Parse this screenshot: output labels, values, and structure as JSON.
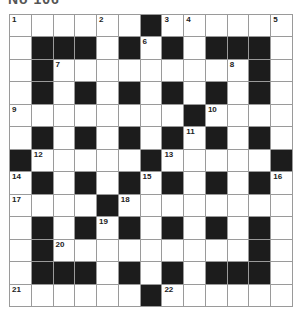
{
  "title": "No 106",
  "puzzle": {
    "rows": 13,
    "cols": 13,
    "colors": {
      "black": "#1c1c1c",
      "white": "#ffffff",
      "gridline": "#9a9a9a"
    },
    "layout": [
      "......#......",
      ".###.#.#.###.",
      ".#.........#.",
      ".#.#.#.#.#.#.",
      "........#....",
      ".#.#.#.#.#.#.",
      "#.....#.....#",
      ".#.#.#.#.#.#.",
      "....#........",
      ".#.#.#.#.#.#.",
      ".#.........#.",
      ".###.#.#.###.",
      "......#......"
    ],
    "numbers": [
      {
        "n": "1",
        "r": 0,
        "c": 0
      },
      {
        "n": "2",
        "r": 0,
        "c": 4
      },
      {
        "n": "3",
        "r": 0,
        "c": 7
      },
      {
        "n": "4",
        "r": 0,
        "c": 8
      },
      {
        "n": "5",
        "r": 0,
        "c": 12
      },
      {
        "n": "6",
        "r": 1,
        "c": 6
      },
      {
        "n": "7",
        "r": 2,
        "c": 2
      },
      {
        "n": "8",
        "r": 2,
        "c": 10
      },
      {
        "n": "9",
        "r": 4,
        "c": 0
      },
      {
        "n": "10",
        "r": 4,
        "c": 9
      },
      {
        "n": "11",
        "r": 5,
        "c": 8
      },
      {
        "n": "12",
        "r": 6,
        "c": 1
      },
      {
        "n": "13",
        "r": 6,
        "c": 7
      },
      {
        "n": "14",
        "r": 7,
        "c": 0
      },
      {
        "n": "15",
        "r": 7,
        "c": 6
      },
      {
        "n": "16",
        "r": 7,
        "c": 12
      },
      {
        "n": "17",
        "r": 8,
        "c": 0
      },
      {
        "n": "18",
        "r": 8,
        "c": 5
      },
      {
        "n": "19",
        "r": 9,
        "c": 4
      },
      {
        "n": "20",
        "r": 10,
        "c": 2
      },
      {
        "n": "21",
        "r": 12,
        "c": 0
      },
      {
        "n": "22",
        "r": 12,
        "c": 7
      }
    ]
  }
}
